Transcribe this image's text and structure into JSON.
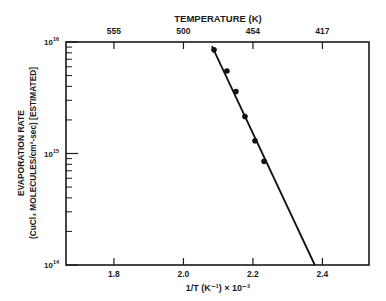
{
  "chart_data": {
    "type": "scatter",
    "title": "",
    "top_axis": {
      "label": "TEMPERATURE (K)",
      "ticks": [
        {
          "label": "555",
          "x": 1.8
        },
        {
          "label": "500",
          "x": 2.0
        },
        {
          "label": "454",
          "x": 2.2
        },
        {
          "label": "417",
          "x": 2.4
        }
      ]
    },
    "xlabel": "1/T (K⁻¹) × 10⁻³",
    "ylabel_line1": "EVAPORATION RATE",
    "ylabel_line2": "(CuCl₃ MOLECULES/cm²-sec) [ESTIMATED]",
    "xlim": [
      1.662,
      2.534
    ],
    "ylim": [
      100000000000000.0,
      1e+16
    ],
    "yscale": "log",
    "xticks": [
      1.8,
      2.0,
      2.2,
      2.4
    ],
    "xtick_labels": [
      "1.8",
      "2.0",
      "2.2",
      "2.4"
    ],
    "yticks": [
      100000000000000.0,
      1000000000000000.0,
      1e+16
    ],
    "ytick_labels": [
      {
        "base": "10",
        "exp": "14"
      },
      {
        "base": "10",
        "exp": "15"
      },
      {
        "base": "10",
        "exp": "16"
      }
    ],
    "grid": false,
    "series": [
      {
        "name": "measured",
        "marker": "filled-circle",
        "points": [
          {
            "x": 2.088,
            "y": 8500000000000000.0
          },
          {
            "x": 2.125,
            "y": 5500000000000000.0
          },
          {
            "x": 2.151,
            "y": 3600000000000000.0
          },
          {
            "x": 2.177,
            "y": 2150000000000000.0
          },
          {
            "x": 2.206,
            "y": 1300000000000000.0
          },
          {
            "x": 2.232,
            "y": 850000000000000.0
          }
        ]
      },
      {
        "name": "fit",
        "style": "line",
        "points": [
          {
            "x": 2.082,
            "y": 9200000000000000.0
          },
          {
            "x": 2.378,
            "y": 100000000000000.0
          }
        ]
      }
    ]
  }
}
